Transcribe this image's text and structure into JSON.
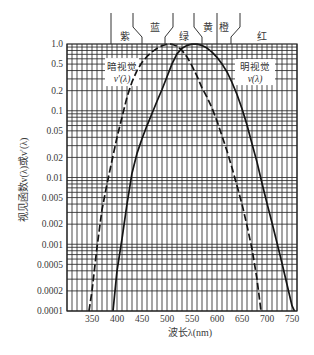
{
  "chart_data": {
    "type": "line",
    "title": "",
    "xlabel": "波长λ(nm)",
    "ylabel": "视见函数v(λ)或v'(λ)",
    "xscale": "linear",
    "yscale": "log",
    "xlim": [
      300,
      760
    ],
    "ylim": [
      0.0001,
      1.0
    ],
    "grid": true,
    "grid_x_step": 10,
    "x_ticks": [
      350,
      400,
      450,
      500,
      550,
      600,
      650,
      700,
      750
    ],
    "y_ticks": [
      {
        "value": 1.0,
        "label": "1.0"
      },
      {
        "value": 0.5,
        "label": "0.5"
      },
      {
        "value": 0.2,
        "label": "0.2"
      },
      {
        "value": 0.1,
        "label": "0.1"
      },
      {
        "value": 0.05,
        "label": "0.05"
      },
      {
        "value": 0.02,
        "label": "0.02"
      },
      {
        "value": 0.01,
        "label": "0.01"
      },
      {
        "value": 0.005,
        "label": "0.005"
      },
      {
        "value": 0.002,
        "label": "0.002"
      },
      {
        "value": 0.001,
        "label": "0.001"
      },
      {
        "value": 0.0005,
        "label": "0.0005"
      },
      {
        "value": 0.0002,
        "label": "0.0002"
      },
      {
        "value": 0.0001,
        "label": "0.0001"
      }
    ],
    "series": [
      {
        "name": "暗视觉 v'(λ)",
        "style": "dashed",
        "x": [
          344,
          350,
          360,
          370,
          380,
          390,
          400,
          410,
          420,
          430,
          440,
          450,
          460,
          470,
          480,
          490,
          500,
          507,
          510,
          520,
          530,
          540,
          550,
          560,
          570,
          580,
          590,
          600,
          610,
          620,
          630,
          640,
          650,
          660,
          670,
          680,
          688
        ],
        "y": [
          0.0001,
          0.0002,
          0.0009,
          0.0033,
          0.008,
          0.018,
          0.04,
          0.08,
          0.16,
          0.27,
          0.4,
          0.53,
          0.65,
          0.76,
          0.86,
          0.94,
          0.99,
          1.0,
          0.99,
          0.93,
          0.8,
          0.64,
          0.47,
          0.33,
          0.22,
          0.16,
          0.11,
          0.07,
          0.042,
          0.025,
          0.014,
          0.0075,
          0.004,
          0.0019,
          0.00085,
          0.0003,
          0.0001
        ]
      },
      {
        "name": "明视觉 v(λ)",
        "style": "solid",
        "x": [
          392,
          400,
          410,
          420,
          430,
          440,
          450,
          460,
          470,
          480,
          490,
          500,
          510,
          520,
          530,
          540,
          550,
          555,
          560,
          570,
          580,
          590,
          600,
          610,
          620,
          630,
          640,
          650,
          660,
          670,
          680,
          690,
          700,
          710,
          720,
          730,
          740,
          750,
          755
        ],
        "y": [
          0.0001,
          0.0004,
          0.0012,
          0.004,
          0.0116,
          0.023,
          0.038,
          0.06,
          0.091,
          0.139,
          0.208,
          0.323,
          0.503,
          0.71,
          0.862,
          0.954,
          0.995,
          1.0,
          0.995,
          0.952,
          0.87,
          0.757,
          0.631,
          0.503,
          0.381,
          0.265,
          0.175,
          0.107,
          0.061,
          0.032,
          0.017,
          0.0082,
          0.0041,
          0.0021,
          0.00105,
          0.00052,
          0.00025,
          0.00012,
          0.0001
        ]
      }
    ],
    "annotations": [
      {
        "id": "scotopic",
        "line1": "暗视觉",
        "line2": "v'(λ)",
        "x": 410,
        "y": 0.5
      },
      {
        "id": "photopic",
        "line1": "明视觉",
        "line2": "v(λ)",
        "x": 676,
        "y": 0.5
      }
    ],
    "color_bands": {
      "dividers": [
        {
          "top": 388,
          "bottom": 388
        },
        {
          "top": 432,
          "bottom": 450
        },
        {
          "top": 512,
          "bottom": 496
        },
        {
          "top": 554,
          "bottom": 570
        },
        {
          "top": 600,
          "bottom": 600
        },
        {
          "top": 646,
          "bottom": 628
        }
      ],
      "labels": [
        {
          "text": "紫",
          "x": 416,
          "row": "low"
        },
        {
          "text": "蓝",
          "x": 476,
          "row": "high"
        },
        {
          "text": "绿",
          "x": 534,
          "row": "low"
        },
        {
          "text": "黄",
          "x": 582,
          "row": "high"
        },
        {
          "text": "橙",
          "x": 614,
          "row": "high"
        },
        {
          "text": "红",
          "x": 690,
          "row": "low"
        }
      ]
    }
  }
}
